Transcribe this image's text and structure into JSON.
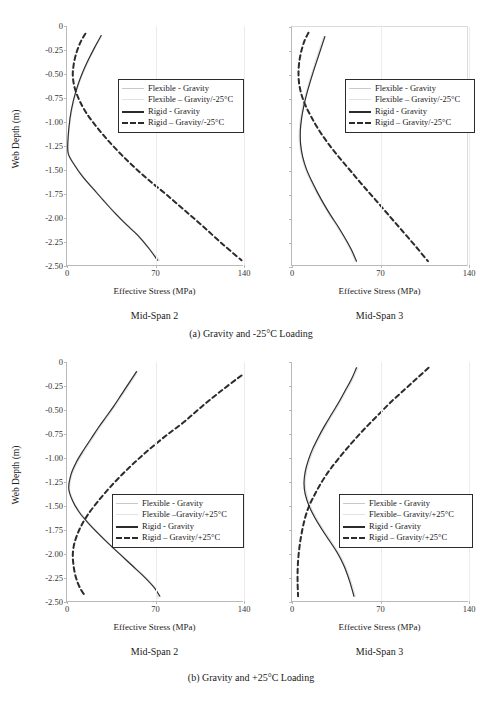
{
  "figure": {
    "top_cut_text": "",
    "captions": [
      "(a) Gravity and -25°C Loading",
      "(b) Gravity and +25°C Loading"
    ]
  },
  "axes": {
    "y_title": "Web Depth (m)",
    "x_title": "Effective Stress (MPa)",
    "y_ticks": [
      "0",
      "-0.25",
      "-0.50",
      "-0.75",
      "-1.00",
      "-1.25",
      "-1.50",
      "-1.75",
      "-2.00",
      "-2.25",
      "-2.50"
    ],
    "y_tick_values": [
      0,
      -0.25,
      -0.5,
      -0.75,
      -1.0,
      -1.25,
      -1.5,
      -1.75,
      -2.0,
      -2.25,
      -2.5
    ],
    "x_ticks": [
      "0",
      "70",
      "140"
    ],
    "x_tick_values": [
      0,
      70,
      140
    ],
    "ylim": [
      -2.5,
      0
    ],
    "xlim": [
      0,
      140
    ]
  },
  "panels": [
    {
      "id": "a-midspan2",
      "span_label": "Mid-Span 2",
      "legend": [
        {
          "label": "Flexible - Gravity",
          "style": "flex-grav"
        },
        {
          "label": "Flexible – Gravity/-25°C",
          "style": "flex-temp"
        },
        {
          "label": "Rigid - Gravity",
          "style": "rigid-grav"
        },
        {
          "label": "Rigid – Gravity/-25°C",
          "style": "rigid-temp"
        }
      ]
    },
    {
      "id": "a-midspan3",
      "span_label": "Mid-Span 3",
      "legend": [
        {
          "label": "Flexible - Gravity",
          "style": "flex-grav"
        },
        {
          "label": "Flexible – Gravity/-25°C",
          "style": "flex-temp"
        },
        {
          "label": "Rigid - Gravity",
          "style": "rigid-grav"
        },
        {
          "label": "Rigid – Gravity/-25°C",
          "style": "rigid-temp"
        }
      ]
    },
    {
      "id": "b-midspan2",
      "span_label": "Mid-Span 2",
      "legend": [
        {
          "label": "Flexible - Gravity",
          "style": "flex-grav"
        },
        {
          "label": "Flexible –Gravity/+25°C",
          "style": "flex-temp"
        },
        {
          "label": "Rigid - Gravity",
          "style": "rigid-grav"
        },
        {
          "label": "Rigid – Gravity/+25°C",
          "style": "rigid-temp"
        }
      ]
    },
    {
      "id": "b-midspan3",
      "span_label": "Mid-Span 3",
      "legend": [
        {
          "label": "Flexible - Gravity",
          "style": "flex-grav"
        },
        {
          "label": "Flexible– Gravity/+25°C",
          "style": "flex-temp"
        },
        {
          "label": "Rigid - Gravity",
          "style": "rigid-grav"
        },
        {
          "label": "Rigid – Gravity/+25°C",
          "style": "rigid-temp"
        }
      ]
    }
  ],
  "colors": {
    "flexible_gravity": "#c9c9c9",
    "flexible_temp": "#e2e2e2",
    "rigid_gravity": "#2b2b2b",
    "rigid_temp": "#2b2b2b",
    "axis": "#b9b9b9",
    "grid": "#ececec",
    "text": "#1a1a1a"
  },
  "chart_data": [
    {
      "type": "line",
      "id": "a-midspan2",
      "title": "Mid-Span 2",
      "subtitle": "(a) Gravity and -25°C Loading",
      "xlabel": "Effective Stress (MPa)",
      "ylabel": "Web Depth (m)",
      "xlim": [
        0,
        140
      ],
      "ylim": [
        -2.5,
        0
      ],
      "xticks": [
        0,
        70,
        140
      ],
      "yticks": [
        0,
        -0.25,
        -0.5,
        -0.75,
        -1.0,
        -1.25,
        -1.5,
        -1.75,
        -2.0,
        -2.25,
        -2.5
      ],
      "grid": "vertical",
      "legend_position": "center-right",
      "series": [
        {
          "name": "Flexible - Gravity",
          "color": "#c9c9c9",
          "dash": "solid",
          "x": [
            27,
            22,
            17,
            12.5,
            8.5,
            5.0,
            2.4,
            0.8,
            1.0,
            6.0,
            13.0,
            21.0,
            29.0,
            38.0,
            47.0,
            56.0,
            65.0,
            72.5
          ],
          "y": [
            -0.1,
            -0.22,
            -0.35,
            -0.48,
            -0.62,
            -0.78,
            -0.96,
            -1.18,
            -1.33,
            -1.45,
            -1.58,
            -1.7,
            -1.82,
            -1.95,
            -2.07,
            -2.18,
            -2.32,
            -2.44
          ]
        },
        {
          "name": "Flexible – Gravity/-25°C",
          "color": "#e2e2e2",
          "dash": "solid",
          "x": [
            27.5,
            22.5,
            17.5,
            13.0,
            9.0,
            5.4,
            2.8,
            1.0,
            1.3,
            6.4,
            13.4,
            21.4,
            29.4,
            38.4,
            47.4,
            56.4,
            65.4,
            73.0
          ],
          "y": [
            -0.1,
            -0.22,
            -0.35,
            -0.48,
            -0.62,
            -0.78,
            -0.96,
            -1.18,
            -1.33,
            -1.45,
            -1.58,
            -1.7,
            -1.82,
            -1.95,
            -2.07,
            -2.18,
            -2.32,
            -2.44
          ]
        },
        {
          "name": "Rigid - Gravity",
          "color": "#2b2b2b",
          "dash": "solid",
          "x": [
            27,
            22,
            17,
            12.5,
            8.5,
            5.0,
            2.4,
            0.8,
            1.0,
            6.0,
            13.0,
            21.0,
            29.0,
            38.0,
            47.0,
            56.0,
            65.0,
            71.5
          ],
          "y": [
            -0.1,
            -0.22,
            -0.35,
            -0.48,
            -0.62,
            -0.78,
            -0.96,
            -1.18,
            -1.33,
            -1.45,
            -1.58,
            -1.7,
            -1.82,
            -1.95,
            -2.07,
            -2.18,
            -2.32,
            -2.44
          ]
        },
        {
          "name": "Rigid – Gravity/-25°C",
          "color": "#2b2b2b",
          "dash": "dashed",
          "x": [
            14.5,
            11.0,
            8.2,
            6.2,
            5.0,
            4.6,
            6.0,
            10.0,
            16.0,
            24.0,
            33.0,
            43.0,
            54.0,
            66.0,
            79.0,
            93.0,
            107.0,
            122.0,
            138.0
          ],
          "y": [
            -0.08,
            -0.16,
            -0.25,
            -0.34,
            -0.43,
            -0.52,
            -0.64,
            -0.78,
            -0.92,
            -1.06,
            -1.2,
            -1.34,
            -1.48,
            -1.62,
            -1.76,
            -1.92,
            -2.08,
            -2.26,
            -2.44
          ]
        }
      ]
    },
    {
      "type": "line",
      "id": "a-midspan3",
      "title": "Mid-Span 3",
      "subtitle": "(a) Gravity and -25°C Loading",
      "xlabel": "Effective Stress (MPa)",
      "ylabel": "Web Depth (m)",
      "xlim": [
        0,
        140
      ],
      "ylim": [
        -2.5,
        0
      ],
      "xticks": [
        0,
        70,
        140
      ],
      "yticks": [
        0,
        -0.25,
        -0.5,
        -0.75,
        -1.0,
        -1.25,
        -1.5,
        -1.75,
        -2.0,
        -2.25,
        -2.5
      ],
      "grid": "vertical",
      "legend_position": "center-right",
      "series": [
        {
          "name": "Flexible - Gravity",
          "color": "#c9c9c9",
          "dash": "solid",
          "x": [
            26,
            23,
            20,
            17,
            14.2,
            11.6,
            9.4,
            7.6,
            6.6,
            6.8,
            8.4,
            11.4,
            15.4,
            20.0,
            25.0,
            30.5,
            36.5,
            42.0,
            47.0,
            51.0
          ],
          "y": [
            -0.1,
            -0.22,
            -0.34,
            -0.46,
            -0.58,
            -0.7,
            -0.82,
            -0.95,
            -1.08,
            -1.22,
            -1.35,
            -1.48,
            -1.6,
            -1.72,
            -1.84,
            -1.96,
            -2.08,
            -2.2,
            -2.32,
            -2.44
          ]
        },
        {
          "name": "Flexible – Gravity/-25°C",
          "color": "#e2e2e2",
          "dash": "solid",
          "x": [
            25.0,
            22.0,
            19.0,
            16.2,
            13.4,
            10.8,
            8.6,
            6.8,
            5.8,
            6.0,
            7.6,
            10.6,
            14.6,
            19.2,
            24.2,
            29.7,
            35.7,
            41.2,
            46.2,
            50.0
          ],
          "y": [
            -0.1,
            -0.22,
            -0.34,
            -0.46,
            -0.58,
            -0.7,
            -0.82,
            -0.95,
            -1.08,
            -1.22,
            -1.35,
            -1.48,
            -1.6,
            -1.72,
            -1.84,
            -1.96,
            -2.08,
            -2.2,
            -2.32,
            -2.44
          ]
        },
        {
          "name": "Rigid - Gravity",
          "color": "#2b2b2b",
          "dash": "solid",
          "x": [
            26,
            23,
            20,
            17,
            14.2,
            11.6,
            9.4,
            7.6,
            6.6,
            6.8,
            8.4,
            11.4,
            15.4,
            20.0,
            25.0,
            30.5,
            36.5,
            42.0,
            47.0,
            51.0
          ],
          "y": [
            -0.1,
            -0.22,
            -0.34,
            -0.46,
            -0.58,
            -0.7,
            -0.82,
            -0.95,
            -1.08,
            -1.22,
            -1.35,
            -1.48,
            -1.6,
            -1.72,
            -1.84,
            -1.96,
            -2.08,
            -2.2,
            -2.32,
            -2.44
          ]
        },
        {
          "name": "Rigid – Gravity/-25°C",
          "color": "#2b2b2b",
          "dash": "dashed",
          "x": [
            13.0,
            10.0,
            7.6,
            6.0,
            5.2,
            5.4,
            7.0,
            10.4,
            15.4,
            21.6,
            29.0,
            37.4,
            46.4,
            56.0,
            66.0,
            76.5,
            87.0,
            97.5,
            107.5
          ],
          "y": [
            -0.06,
            -0.14,
            -0.24,
            -0.34,
            -0.45,
            -0.56,
            -0.68,
            -0.81,
            -0.94,
            -1.08,
            -1.22,
            -1.36,
            -1.5,
            -1.65,
            -1.8,
            -1.96,
            -2.12,
            -2.28,
            -2.44
          ]
        }
      ]
    },
    {
      "type": "line",
      "id": "b-midspan2",
      "title": "Mid-Span 2",
      "subtitle": "(b) Gravity and +25°C Loading",
      "xlabel": "Effective Stress (MPa)",
      "ylabel": "Web Depth (m)",
      "xlim": [
        0,
        140
      ],
      "ylim": [
        -2.5,
        0
      ],
      "xticks": [
        0,
        70,
        140
      ],
      "yticks": [
        0,
        -0.25,
        -0.5,
        -0.75,
        -1.0,
        -1.25,
        -1.5,
        -1.75,
        -2.0,
        -2.25,
        -2.5
      ],
      "grid": "vertical",
      "legend_position": "center",
      "series": [
        {
          "name": "Flexible - Gravity",
          "color": "#c9c9c9",
          "dash": "solid",
          "x": [
            55,
            49,
            43,
            37,
            31,
            25,
            19,
            13,
            7.5,
            3.2,
            1.4,
            4.6,
            10.0,
            17.0,
            25.0,
            33.5,
            42.5,
            51.5,
            60.5,
            69.0,
            73.0
          ],
          "y": [
            -0.1,
            -0.22,
            -0.34,
            -0.46,
            -0.57,
            -0.68,
            -0.8,
            -0.92,
            -1.04,
            -1.17,
            -1.32,
            -1.45,
            -1.57,
            -1.68,
            -1.79,
            -1.9,
            -2.01,
            -2.12,
            -2.23,
            -2.35,
            -2.44
          ]
        },
        {
          "name": "Flexible –Gravity/+25°C",
          "color": "#e2e2e2",
          "dash": "solid",
          "x": [
            56,
            50,
            44,
            38,
            32,
            26,
            20,
            14,
            8.5,
            4.0,
            2.0,
            5.2,
            10.6,
            17.6,
            25.6,
            34.1,
            43.1,
            52.1,
            61.1,
            69.5,
            72.0
          ],
          "y": [
            -0.1,
            -0.22,
            -0.34,
            -0.46,
            -0.57,
            -0.68,
            -0.8,
            -0.92,
            -1.04,
            -1.17,
            -1.32,
            -1.45,
            -1.57,
            -1.68,
            -1.79,
            -1.9,
            -2.01,
            -2.12,
            -2.23,
            -2.35,
            -2.46
          ]
        },
        {
          "name": "Rigid - Gravity",
          "color": "#2b2b2b",
          "dash": "solid",
          "x": [
            55,
            49,
            43,
            37,
            31,
            25,
            19,
            13,
            7.5,
            3.2,
            1.4,
            4.6,
            10.0,
            17.0,
            25.0,
            33.5,
            42.5,
            51.5,
            60.5,
            69.0,
            73.5
          ],
          "y": [
            -0.1,
            -0.22,
            -0.34,
            -0.46,
            -0.57,
            -0.68,
            -0.8,
            -0.92,
            -1.04,
            -1.17,
            -1.32,
            -1.45,
            -1.57,
            -1.68,
            -1.79,
            -1.9,
            -2.01,
            -2.12,
            -2.23,
            -2.35,
            -2.44
          ]
        },
        {
          "name": "Rigid – Gravity/+25°C",
          "color": "#2b2b2b",
          "dash": "dashed",
          "x": [
            138,
            122,
            107,
            93,
            79,
            66,
            54,
            43,
            33,
            24,
            16,
            10,
            6.0,
            4.6,
            5.0,
            6.2,
            8.2,
            11.0,
            14.5
          ],
          "y": [
            -0.14,
            -0.3,
            -0.46,
            -0.62,
            -0.76,
            -0.9,
            -1.04,
            -1.18,
            -1.32,
            -1.46,
            -1.6,
            -1.74,
            -1.88,
            -2.0,
            -2.1,
            -2.2,
            -2.29,
            -2.37,
            -2.44
          ]
        }
      ]
    },
    {
      "type": "line",
      "id": "b-midspan3",
      "title": "Mid-Span 3",
      "subtitle": "(b) Gravity and +25°C Loading",
      "xlabel": "Effective Stress (MPa)",
      "ylabel": "Web Depth (m)",
      "xlim": [
        0,
        140
      ],
      "ylim": [
        -2.5,
        0
      ],
      "xticks": [
        0,
        70,
        140
      ],
      "yticks": [
        0,
        -0.25,
        -0.5,
        -0.75,
        -1.0,
        -1.25,
        -1.5,
        -1.75,
        -2.0,
        -2.25,
        -2.5
      ],
      "grid": "vertical",
      "legend_position": "center-right",
      "series": [
        {
          "name": "Flexible - Gravity",
          "color": "#c9c9c9",
          "dash": "solid",
          "x": [
            51,
            47,
            42,
            37,
            31.5,
            26,
            21,
            16.5,
            13,
            10.5,
            9.5,
            10.5,
            13.5,
            18,
            23.5,
            29.5,
            35.5,
            41,
            45.5,
            49
          ],
          "y": [
            -0.06,
            -0.18,
            -0.3,
            -0.42,
            -0.54,
            -0.66,
            -0.78,
            -0.9,
            -1.02,
            -1.14,
            -1.26,
            -1.38,
            -1.5,
            -1.62,
            -1.74,
            -1.86,
            -1.98,
            -2.12,
            -2.28,
            -2.44
          ]
        },
        {
          "name": "Flexible– Gravity/+25°C",
          "color": "#e2e2e2",
          "dash": "solid",
          "x": [
            52,
            48,
            43,
            38,
            32.5,
            27,
            22,
            17.5,
            14,
            11.5,
            10.5,
            11.5,
            14.5,
            19,
            24.5,
            30.5,
            36.5,
            42,
            46.5,
            50
          ],
          "y": [
            -0.06,
            -0.18,
            -0.3,
            -0.42,
            -0.54,
            -0.66,
            -0.78,
            -0.9,
            -1.02,
            -1.14,
            -1.26,
            -1.38,
            -1.5,
            -1.62,
            -1.74,
            -1.86,
            -1.98,
            -2.12,
            -2.28,
            -2.44
          ]
        },
        {
          "name": "Rigid - Gravity",
          "color": "#2b2b2b",
          "dash": "solid",
          "x": [
            51,
            47,
            42,
            37,
            31.5,
            26,
            21,
            16.5,
            13,
            10.5,
            9.5,
            10.5,
            13.5,
            18,
            23.5,
            29.5,
            35.5,
            41,
            45.5,
            49
          ],
          "y": [
            -0.06,
            -0.18,
            -0.3,
            -0.42,
            -0.54,
            -0.66,
            -0.78,
            -0.9,
            -1.02,
            -1.14,
            -1.26,
            -1.38,
            -1.5,
            -1.62,
            -1.74,
            -1.86,
            -1.98,
            -2.12,
            -2.28,
            -2.44
          ]
        },
        {
          "name": "Rigid – Gravity/+25°C",
          "color": "#2b2b2b",
          "dash": "dashed",
          "x": [
            108,
            98,
            88,
            78,
            69,
            60,
            51.5,
            43.5,
            36,
            29,
            23,
            18,
            13.5,
            10,
            7.4,
            5.6,
            4.6,
            4.4,
            4.8
          ],
          "y": [
            -0.06,
            -0.18,
            -0.3,
            -0.42,
            -0.54,
            -0.66,
            -0.78,
            -0.9,
            -1.02,
            -1.14,
            -1.26,
            -1.38,
            -1.5,
            -1.64,
            -1.8,
            -1.96,
            -2.12,
            -2.28,
            -2.44
          ]
        }
      ]
    }
  ]
}
